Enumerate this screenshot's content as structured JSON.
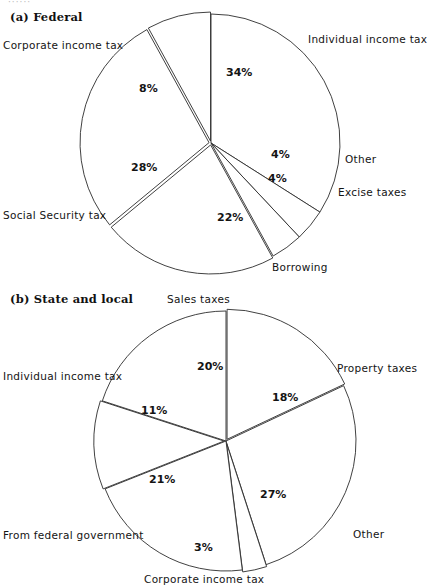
{
  "figure": {
    "top_scrap_text": "······",
    "panel_a_caption": "(a) Federal",
    "panel_b_caption": "(b) State and local",
    "line_color": "#2b2b2b",
    "fill_color": "#ffffff",
    "text_color": "#141414"
  },
  "chart_data": [
    {
      "type": "pie",
      "title": "(a) Federal",
      "id": "federal",
      "center": {
        "x": 211,
        "y": 143
      },
      "radius": 129,
      "start_angle_deg": -90,
      "direction": "clockwise",
      "labels_unit": "%",
      "categories": [
        "Individual income tax",
        "Other",
        "Excise taxes",
        "Borrowing",
        "Social Security tax",
        "Corporate income tax"
      ],
      "values": [
        34,
        4,
        4,
        22,
        28,
        8
      ],
      "value_labels": [
        "34%",
        "4%",
        "4%",
        "22%",
        "28%",
        "8%"
      ],
      "exploded": [
        false,
        false,
        false,
        true,
        true,
        true
      ],
      "legend": "none",
      "xlabel": "",
      "ylabel": ""
    },
    {
      "type": "pie",
      "title": "(b) State and local",
      "id": "state-local",
      "center": {
        "x": 226,
        "y": 441
      },
      "radius": 130,
      "start_angle_deg": -90,
      "direction": "clockwise",
      "labels_unit": "%",
      "categories": [
        "Property taxes",
        "Other",
        "Corporate income tax",
        "From federal government",
        "Individual income tax",
        "Sales taxes"
      ],
      "values": [
        18,
        27,
        3,
        21,
        11,
        20
      ],
      "value_labels": [
        "18%",
        "27%",
        "3%",
        "21%",
        "11%",
        "20%"
      ],
      "exploded": [
        true,
        false,
        true,
        false,
        true,
        false
      ],
      "legend": "none",
      "xlabel": "",
      "ylabel": ""
    }
  ],
  "panel_a": {
    "caption": "(a) Federal",
    "labels": {
      "corporate_income_tax": "Corporate income tax",
      "individual_income_tax": "Individual income tax",
      "other": "Other",
      "excise_taxes": "Excise taxes",
      "social_security_tax": "Social Security tax",
      "borrowing": "Borrowing"
    },
    "percents": {
      "individual_income_tax": "34%",
      "corporate_income_tax": "8%",
      "social_security_tax": "28%",
      "other": "4%",
      "excise_taxes": "4%",
      "borrowing": "22%"
    }
  },
  "panel_b": {
    "caption": "(b) State and local",
    "labels": {
      "sales_taxes": "Sales taxes",
      "property_taxes": "Property taxes",
      "individual_income_tax": "Individual income tax",
      "other": "Other",
      "from_federal_government": "From federal government",
      "corporate_income_tax": "Corporate income tax"
    },
    "percents": {
      "sales_taxes": "20%",
      "property_taxes": "18%",
      "individual_income_tax": "11%",
      "from_federal_government": "21%",
      "other": "27%",
      "corporate_income_tax": "3%"
    }
  }
}
